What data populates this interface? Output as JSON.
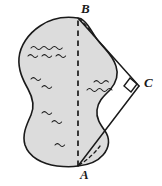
{
  "figure": {
    "background_color": "#ffffff",
    "lake": {
      "name": "lake-region",
      "fill_color": "#dcdcdc",
      "stroke_color": "#1a1a1a",
      "stroke_width": 1.6,
      "water_marks": "wave-ripples"
    },
    "points": [
      {
        "id": "B",
        "label": "B",
        "label_x": 81,
        "label_y": 2,
        "x": 78,
        "y": 18
      },
      {
        "id": "A",
        "label": "A",
        "label_x": 80,
        "label_y": 168,
        "x": 78,
        "y": 166
      },
      {
        "id": "C",
        "label": "C",
        "label_x": 144,
        "label_y": 76,
        "x": 139,
        "y": 86
      }
    ],
    "segments": [
      {
        "id": "AB",
        "name": "segment-ab",
        "style": "dashed",
        "from": "A",
        "to": "B",
        "color": "#1a1a1a"
      },
      {
        "id": "BC",
        "name": "segment-bc",
        "style": "solid",
        "from": "B",
        "to": "C",
        "color": "#1a1a1a"
      },
      {
        "id": "AC",
        "name": "segment-ac",
        "style": "solid",
        "from": "A",
        "to": "C",
        "color": "#1a1a1a"
      }
    ],
    "angle_markers": [
      {
        "id": "right-angle-C",
        "at": "C",
        "type": "right-angle",
        "symbol": "square"
      }
    ],
    "dashed_shore_arcs": [
      {
        "id": "shore-arc-top",
        "name": "dashed-shore-arc-top"
      },
      {
        "id": "shore-arc-bottom",
        "name": "dashed-shore-arc-bottom"
      }
    ]
  }
}
